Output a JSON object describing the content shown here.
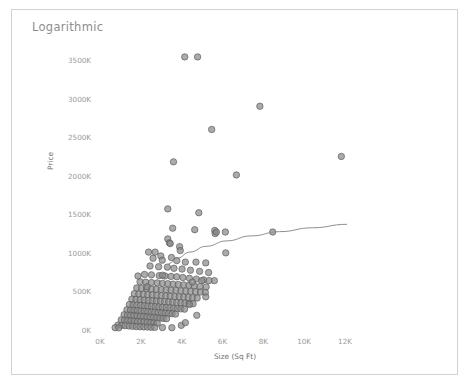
{
  "chart": {
    "title": "Logarithmic",
    "axis_label_color": "#6f6f6f",
    "tick_color": "#9a9a9a",
    "marker_color": "#8a8a8a",
    "marker_border_color": "#5d5d5d",
    "trend_color": "#8f8f8f",
    "frame_color": "#d2d2d2"
  },
  "chart_data": {
    "type": "scatter",
    "title": "Logarithmic",
    "xlabel": "Size (Sq Ft)",
    "ylabel": "Price",
    "grid": false,
    "legend": "none",
    "xlim": [
      0,
      13000
    ],
    "ylim": [
      0,
      3700000
    ],
    "xticks": [
      0,
      2000,
      4000,
      6000,
      8000,
      10000,
      12000
    ],
    "xtick_labels": [
      "0K",
      "2K",
      "4K",
      "6K",
      "8K",
      "10K",
      "12K"
    ],
    "yticks": [
      0,
      500000,
      1000000,
      1500000,
      2000000,
      2500000,
      3000000,
      3500000
    ],
    "ytick_labels": [
      "0K",
      "500K",
      "1000K",
      "1500K",
      "2000K",
      "2500K",
      "3000K",
      "3500K"
    ],
    "series": [
      {
        "name": "Listings",
        "marker": "circle",
        "points": [
          [
            4150,
            3540000
          ],
          [
            4780,
            3540000
          ],
          [
            5470,
            2600000
          ],
          [
            7830,
            2900000
          ],
          [
            11820,
            2250000
          ],
          [
            3600,
            2180000
          ],
          [
            6680,
            2010000
          ],
          [
            3320,
            1570000
          ],
          [
            4840,
            1520000
          ],
          [
            3560,
            1320000
          ],
          [
            5620,
            1290000
          ],
          [
            6140,
            1270000
          ],
          [
            5640,
            1250000
          ],
          [
            3320,
            1180000
          ],
          [
            3400,
            1130000
          ],
          [
            3440,
            1120000
          ],
          [
            3900,
            1080000
          ],
          [
            3930,
            1030000
          ],
          [
            8460,
            1270000
          ],
          [
            6160,
            1000000
          ],
          [
            2980,
            960000
          ],
          [
            3500,
            940000
          ],
          [
            2600,
            930000
          ],
          [
            3050,
            905000
          ],
          [
            3760,
            900000
          ],
          [
            4180,
            880000
          ],
          [
            4700,
            880000
          ],
          [
            5180,
            870000
          ],
          [
            2450,
            830000
          ],
          [
            2870,
            820000
          ],
          [
            3300,
            815000
          ],
          [
            3620,
            800000
          ],
          [
            4020,
            790000
          ],
          [
            4430,
            775000
          ],
          [
            4880,
            760000
          ],
          [
            5320,
            745000
          ],
          [
            2180,
            720000
          ],
          [
            2520,
            715000
          ],
          [
            2900,
            705000
          ],
          [
            3180,
            700000
          ],
          [
            3480,
            695000
          ],
          [
            3760,
            690000
          ],
          [
            4060,
            680000
          ],
          [
            4380,
            670000
          ],
          [
            4720,
            660000
          ],
          [
            5080,
            650000
          ],
          [
            5600,
            640000
          ],
          [
            1960,
            625000
          ],
          [
            2240,
            620000
          ],
          [
            2520,
            615000
          ],
          [
            2800,
            610000
          ],
          [
            3060,
            605000
          ],
          [
            3320,
            600000
          ],
          [
            3580,
            595000
          ],
          [
            3840,
            590000
          ],
          [
            4100,
            585000
          ],
          [
            4360,
            580000
          ],
          [
            4620,
            572000
          ],
          [
            4900,
            565000
          ],
          [
            5200,
            558000
          ],
          [
            1800,
            545000
          ],
          [
            2040,
            540000
          ],
          [
            2280,
            536000
          ],
          [
            2520,
            532000
          ],
          [
            2760,
            528000
          ],
          [
            3000,
            524000
          ],
          [
            3240,
            520000
          ],
          [
            3480,
            516000
          ],
          [
            3720,
            512000
          ],
          [
            3960,
            508000
          ],
          [
            4200,
            504000
          ],
          [
            4440,
            500000
          ],
          [
            4680,
            496000
          ],
          [
            4920,
            492000
          ],
          [
            5160,
            486000
          ],
          [
            1680,
            470000
          ],
          [
            1900,
            466000
          ],
          [
            2120,
            462000
          ],
          [
            2340,
            458000
          ],
          [
            2560,
            454000
          ],
          [
            2780,
            450000
          ],
          [
            3000,
            446000
          ],
          [
            3220,
            442000
          ],
          [
            3440,
            438000
          ],
          [
            3660,
            434000
          ],
          [
            3880,
            430000
          ],
          [
            4100,
            426000
          ],
          [
            4320,
            422000
          ],
          [
            4540,
            418000
          ],
          [
            4760,
            414000
          ],
          [
            1560,
            400000
          ],
          [
            1760,
            396000
          ],
          [
            1960,
            392000
          ],
          [
            2160,
            388000
          ],
          [
            2360,
            384000
          ],
          [
            2560,
            380000
          ],
          [
            2760,
            376000
          ],
          [
            2960,
            372000
          ],
          [
            3160,
            368000
          ],
          [
            3360,
            364000
          ],
          [
            3560,
            360000
          ],
          [
            3760,
            356000
          ],
          [
            3960,
            352000
          ],
          [
            4160,
            348000
          ],
          [
            4360,
            344000
          ],
          [
            4560,
            340000
          ],
          [
            1440,
            330000
          ],
          [
            1620,
            326000
          ],
          [
            1800,
            322000
          ],
          [
            1980,
            318000
          ],
          [
            2160,
            314000
          ],
          [
            2340,
            310000
          ],
          [
            2520,
            306000
          ],
          [
            2700,
            302000
          ],
          [
            2880,
            298000
          ],
          [
            3060,
            294000
          ],
          [
            3240,
            290000
          ],
          [
            3420,
            286000
          ],
          [
            3600,
            282000
          ],
          [
            3780,
            278000
          ],
          [
            3960,
            274000
          ],
          [
            4140,
            270000
          ],
          [
            1320,
            262000
          ],
          [
            1490,
            258000
          ],
          [
            1660,
            254000
          ],
          [
            1830,
            250000
          ],
          [
            2000,
            246000
          ],
          [
            2170,
            242000
          ],
          [
            2340,
            238000
          ],
          [
            2510,
            234000
          ],
          [
            2680,
            230000
          ],
          [
            2850,
            226000
          ],
          [
            3020,
            222000
          ],
          [
            3190,
            218000
          ],
          [
            3360,
            214000
          ],
          [
            3530,
            210000
          ],
          [
            3700,
            206000
          ],
          [
            1180,
            198000
          ],
          [
            1340,
            194000
          ],
          [
            1500,
            190000
          ],
          [
            1660,
            186000
          ],
          [
            1820,
            182000
          ],
          [
            1980,
            178000
          ],
          [
            2140,
            174000
          ],
          [
            2300,
            170000
          ],
          [
            2460,
            166000
          ],
          [
            2620,
            162000
          ],
          [
            2780,
            158000
          ],
          [
            2940,
            154000
          ],
          [
            3100,
            150000
          ],
          [
            3260,
            146000
          ],
          [
            1040,
            132000
          ],
          [
            1200,
            128000
          ],
          [
            1360,
            124000
          ],
          [
            1520,
            120000
          ],
          [
            1680,
            116000
          ],
          [
            1840,
            112000
          ],
          [
            2000,
            108000
          ],
          [
            2160,
            104000
          ],
          [
            2320,
            100000
          ],
          [
            2480,
            96000
          ],
          [
            2640,
            92000
          ],
          [
            2800,
            88000
          ],
          [
            880,
            64000
          ],
          [
            1060,
            60000
          ],
          [
            1240,
            56000
          ],
          [
            1420,
            52000
          ],
          [
            1600,
            48000
          ],
          [
            1780,
            44000
          ],
          [
            1960,
            42000
          ],
          [
            2140,
            40000
          ],
          [
            2320,
            38000
          ],
          [
            2500,
            36000
          ],
          [
            2680,
            34000
          ],
          [
            3060,
            32000
          ],
          [
            3520,
            30000
          ],
          [
            740,
            30000
          ],
          [
            920,
            28000
          ],
          [
            3980,
            60000
          ],
          [
            4380,
            330000
          ],
          [
            4520,
            620000
          ],
          [
            4980,
            640000
          ],
          [
            5180,
            430000
          ],
          [
            5340,
            640000
          ],
          [
            4740,
            190000
          ],
          [
            4180,
            95000
          ],
          [
            2380,
            1010000
          ],
          [
            2700,
            1010000
          ],
          [
            3060,
            710000
          ],
          [
            2300,
            560000
          ],
          [
            1860,
            700000
          ],
          [
            4640,
            1300000
          ],
          [
            5700,
            1270000
          ]
        ]
      }
    ],
    "trend": {
      "name": "Logarithmic fit",
      "type": "logarithmic",
      "points": [
        [
          3360,
          860000
        ],
        [
          3800,
          935000
        ],
        [
          4400,
          1010000
        ],
        [
          5200,
          1085000
        ],
        [
          6200,
          1155000
        ],
        [
          7400,
          1220000
        ],
        [
          8800,
          1275000
        ],
        [
          10400,
          1325000
        ],
        [
          12100,
          1370000
        ]
      ]
    }
  }
}
